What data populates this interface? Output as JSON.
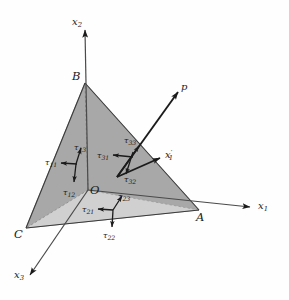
{
  "figure": {
    "background_color": "#fefefe",
    "line_color": "#1b1b1b",
    "face_front_color": "#a9a9a9",
    "face_bottom_color": "#d7d7d7",
    "face_left_color": "#c4c4c4"
  },
  "axes": [
    {
      "name": "x1",
      "label": "x",
      "subscript": "1",
      "prime": ""
    },
    {
      "name": "x2",
      "label": "x",
      "subscript": "2",
      "prime": ""
    },
    {
      "name": "x3",
      "label": "x",
      "subscript": "3",
      "prime": ""
    },
    {
      "name": "x1prime",
      "label": "x",
      "subscript": "1",
      "prime": "′"
    }
  ],
  "vertices": [
    {
      "name": "O",
      "label": "O"
    },
    {
      "name": "A",
      "label": "A"
    },
    {
      "name": "B",
      "label": "B"
    },
    {
      "name": "C",
      "label": "C"
    }
  ],
  "traction": {
    "name": "p",
    "label": "p"
  },
  "stress_components": [
    {
      "name": "tau11",
      "label": "τ",
      "subscript": "11",
      "face": "left"
    },
    {
      "name": "tau12",
      "label": "τ",
      "subscript": "12",
      "face": "left"
    },
    {
      "name": "tau13",
      "label": "τ",
      "subscript": "13",
      "face": "left"
    },
    {
      "name": "tau21",
      "label": "τ",
      "subscript": "21",
      "face": "bottom"
    },
    {
      "name": "tau22",
      "label": "τ",
      "subscript": "22",
      "face": "bottom"
    },
    {
      "name": "tau23",
      "label": "τ",
      "subscript": "23",
      "face": "bottom"
    },
    {
      "name": "tau31",
      "label": "τ",
      "subscript": "31",
      "face": "inclined"
    },
    {
      "name": "tau32",
      "label": "τ",
      "subscript": "32",
      "face": "inclined"
    },
    {
      "name": "tau33",
      "label": "τ",
      "subscript": "33",
      "face": "inclined"
    }
  ]
}
